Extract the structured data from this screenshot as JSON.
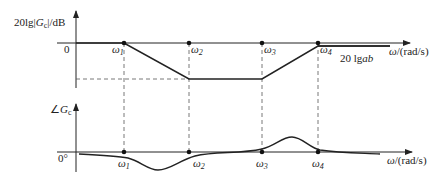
{
  "figure": {
    "magnitude": {
      "y_label_prefix": "20lg",
      "y_label_var": "G",
      "y_label_sub": "c",
      "y_label_unit": "/dB",
      "zero_label": "0",
      "x_label_var": "ω",
      "x_label_unit": "/(rad/s)",
      "annotation_prefix": "20 lg",
      "annotation_var": "ab"
    },
    "phase": {
      "y_label_symbol": "∠",
      "y_label_var": "G",
      "y_label_sub": "c",
      "zero_label": "0°",
      "x_label_var": "ω",
      "x_label_unit": "/(rad/s)"
    },
    "frequencies": [
      {
        "sym": "ω",
        "sub": "1"
      },
      {
        "sym": "ω",
        "sub": "2"
      },
      {
        "sym": "ω",
        "sub": "3"
      },
      {
        "sym": "ω",
        "sub": "4"
      }
    ]
  }
}
